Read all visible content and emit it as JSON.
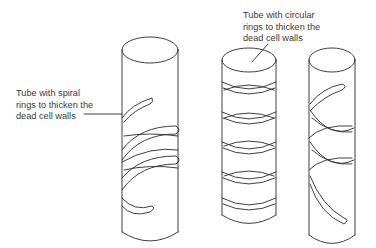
{
  "diagram": {
    "labels": {
      "spiral": [
        "Tube with spiral",
        "rings to thicken the",
        "dead cell walls"
      ],
      "circular": [
        "Tube with circular",
        "rings to thicken the",
        "dead cell walls"
      ]
    },
    "tubes": [
      {
        "id": "tube-1",
        "type": "spiral",
        "labelled": true
      },
      {
        "id": "tube-2",
        "type": "circular rings",
        "ring_count": 5,
        "labelled": true
      },
      {
        "id": "tube-3",
        "type": "spiral",
        "labelled": false
      }
    ],
    "colors": {
      "line": "#2a2a2a",
      "text": "#3a3a3a",
      "background": "#ffffff"
    }
  }
}
